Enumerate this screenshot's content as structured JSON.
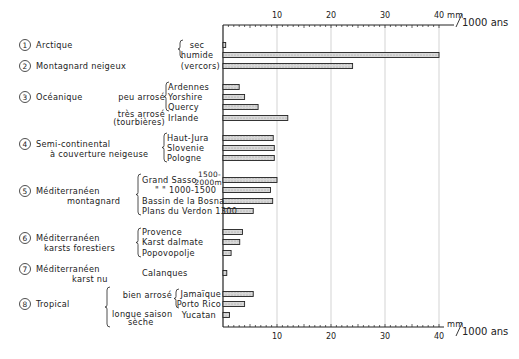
{
  "chart_data": {
    "type": "bar",
    "orientation": "horizontal",
    "title": "",
    "xlabel": "mm/1000 ans",
    "ylabel": "",
    "xlim": [
      0,
      40
    ],
    "xticks": [
      10,
      20,
      30,
      40
    ],
    "grid": true,
    "unit_top": {
      "num": "mm",
      "den": "1000 ans"
    },
    "unit_bottom": {
      "num": "mm",
      "den": "1000 ans"
    },
    "groups": [
      {
        "id": "1",
        "name": "Arctique",
        "name2": ""
      },
      {
        "id": "2",
        "name": "Montagnard neigeux",
        "name2": ""
      },
      {
        "id": "3",
        "name": "Océanique",
        "name2": ""
      },
      {
        "id": "4",
        "name": "Semi-continental",
        "name2": "à couverture neigeuse"
      },
      {
        "id": "5",
        "name": "Méditerranéen",
        "name2": "montagnard"
      },
      {
        "id": "6",
        "name": "Méditerranéen",
        "name2": "karsts forestiers"
      },
      {
        "id": "7",
        "name": "Méditerranéen",
        "name2": "karst nu"
      },
      {
        "id": "8",
        "name": "Tropical",
        "name2": ""
      }
    ],
    "subgroups": [
      {
        "label": "peu arrosé",
        "group": "3"
      },
      {
        "label": "très arrosé",
        "label2": "(tourbières)",
        "group": "3"
      },
      {
        "label": "bien arrosé",
        "group": "8"
      },
      {
        "label": "longue saison",
        "label2": "sèche",
        "group": "8"
      }
    ],
    "categories": [
      "sec",
      "humide",
      "(vercors)",
      "Ardennes",
      "Yorshire",
      "Quercy",
      "Irlande",
      "Haut-Jura",
      "Slovenie",
      "Pologne",
      "Grand Sasso 1500-2000m",
      "\" \" 1000-1500",
      "Bassin de la Bosna",
      "Plans du Verdon 1300",
      "Provence",
      "Karst dalmate",
      "Popovopoljé",
      "Calanques",
      "Jamaïque",
      "Porto Rico",
      "Yucatan"
    ],
    "values": [
      0.5,
      40,
      24,
      3,
      4,
      6.5,
      12,
      9.3,
      9.5,
      9.5,
      10,
      8.8,
      9.2,
      5.6,
      3.6,
      3.1,
      1.5,
      0.7,
      5.6,
      4,
      1.2
    ],
    "rows": [
      {
        "label": "sec",
        "value": 0.5,
        "y": 45,
        "group": "1"
      },
      {
        "label": "humide",
        "value": 40,
        "y": 55,
        "group": "1"
      },
      {
        "label": "(vercors)",
        "value": 24,
        "y": 66,
        "group": "2"
      },
      {
        "label": "Ardennes",
        "value": 3,
        "y": 87,
        "group": "3"
      },
      {
        "label": "Yorshire",
        "value": 4,
        "y": 97,
        "group": "3"
      },
      {
        "label": "Quercy",
        "value": 6.5,
        "y": 107,
        "group": "3"
      },
      {
        "label": "Irlande",
        "value": 12,
        "y": 118,
        "group": "3"
      },
      {
        "label": "Haut-Jura",
        "value": 9.3,
        "y": 138,
        "group": "4"
      },
      {
        "label": "Slovenie",
        "value": 9.5,
        "y": 148,
        "group": "4"
      },
      {
        "label": "Pologne",
        "value": 9.5,
        "y": 158,
        "group": "4"
      },
      {
        "label": "Grand Sasso",
        "value": 10,
        "y": 180,
        "group": "5"
      },
      {
        "label": "\"      \" 1000-1500",
        "value": 8.8,
        "y": 190,
        "group": "5"
      },
      {
        "label": "Bassin de la Bosna",
        "value": 9.2,
        "y": 201,
        "group": "5"
      },
      {
        "label": "Plans du Verdon 1300",
        "value": 5.6,
        "y": 211,
        "group": "5"
      },
      {
        "label": "Provence",
        "value": 3.6,
        "y": 232,
        "group": "6"
      },
      {
        "label": "Karst dalmate",
        "value": 3.1,
        "y": 242,
        "group": "6"
      },
      {
        "label": "Popovopolje",
        "value": 1.5,
        "y": 253,
        "group": "6"
      },
      {
        "label": "Calanques",
        "value": 0.7,
        "y": 273,
        "group": "7"
      },
      {
        "label": "Jamaïque",
        "value": 5.6,
        "y": 294,
        "group": "8"
      },
      {
        "label": "Porto Rico",
        "value": 4,
        "y": 304,
        "group": "8"
      },
      {
        "label": "Yucatan",
        "value": 1.2,
        "y": 315,
        "group": "8"
      }
    ],
    "annotations": {
      "grand_sasso_alt_top": "1500-",
      "grand_sasso_alt_bottom": "2000m"
    }
  }
}
